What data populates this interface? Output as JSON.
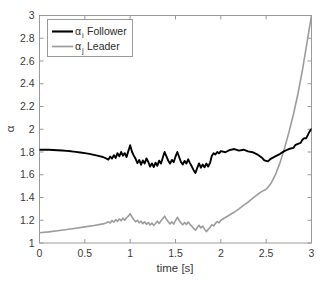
{
  "chart_data": {
    "type": "line",
    "title": "",
    "xlabel": "time [s]",
    "ylabel": "α",
    "xlim": [
      0,
      3
    ],
    "ylim": [
      1,
      3
    ],
    "grid": false,
    "legend_position": "top-left",
    "xticks": [
      "0",
      "0.5",
      "1",
      "1.5",
      "2",
      "2.5",
      "3"
    ],
    "xtick_values": [
      0,
      0.5,
      1,
      1.5,
      2,
      2.5,
      3
    ],
    "yticks": [
      "1",
      "1.2",
      "1.4",
      "1.6",
      "1.8",
      "2",
      "2.2",
      "2.4",
      "2.6",
      "2.8",
      "3"
    ],
    "ytick_values": [
      1,
      1.2,
      1.4,
      1.6,
      1.8,
      2,
      2.2,
      2.4,
      2.6,
      2.8,
      3
    ],
    "series": [
      {
        "name": "αi Follower",
        "label_base": "α",
        "label_sub": "i",
        "label_rest": "Follower",
        "color": "#000000",
        "width": 1.9,
        "points": [
          [
            0.0,
            1.82
          ],
          [
            0.05,
            1.821
          ],
          [
            0.1,
            1.82
          ],
          [
            0.15,
            1.818
          ],
          [
            0.2,
            1.816
          ],
          [
            0.25,
            1.813
          ],
          [
            0.3,
            1.81
          ],
          [
            0.35,
            1.806
          ],
          [
            0.4,
            1.801
          ],
          [
            0.45,
            1.796
          ],
          [
            0.5,
            1.79
          ],
          [
            0.55,
            1.783
          ],
          [
            0.6,
            1.775
          ],
          [
            0.65,
            1.766
          ],
          [
            0.7,
            1.756
          ],
          [
            0.74,
            1.742
          ],
          [
            0.76,
            1.733
          ],
          [
            0.78,
            1.76
          ],
          [
            0.8,
            1.742
          ],
          [
            0.82,
            1.772
          ],
          [
            0.84,
            1.748
          ],
          [
            0.86,
            1.79
          ],
          [
            0.88,
            1.762
          ],
          [
            0.9,
            1.8
          ],
          [
            0.92,
            1.768
          ],
          [
            0.94,
            1.79
          ],
          [
            0.96,
            1.756
          ],
          [
            0.98,
            1.808
          ],
          [
            1.0,
            1.86
          ],
          [
            1.02,
            1.802
          ],
          [
            1.04,
            1.768
          ],
          [
            1.06,
            1.74
          ],
          [
            1.08,
            1.702
          ],
          [
            1.1,
            1.73
          ],
          [
            1.12,
            1.688
          ],
          [
            1.14,
            1.726
          ],
          [
            1.16,
            1.7
          ],
          [
            1.18,
            1.744
          ],
          [
            1.2,
            1.712
          ],
          [
            1.22,
            1.672
          ],
          [
            1.24,
            1.7
          ],
          [
            1.26,
            1.668
          ],
          [
            1.28,
            1.706
          ],
          [
            1.3,
            1.68
          ],
          [
            1.32,
            1.724
          ],
          [
            1.34,
            1.698
          ],
          [
            1.36,
            1.752
          ],
          [
            1.38,
            1.8
          ],
          [
            1.4,
            1.762
          ],
          [
            1.42,
            1.724
          ],
          [
            1.44,
            1.698
          ],
          [
            1.46,
            1.73
          ],
          [
            1.48,
            1.71
          ],
          [
            1.5,
            1.76
          ],
          [
            1.52,
            1.8
          ],
          [
            1.54,
            1.756
          ],
          [
            1.56,
            1.712
          ],
          [
            1.58,
            1.69
          ],
          [
            1.6,
            1.722
          ],
          [
            1.62,
            1.698
          ],
          [
            1.64,
            1.736
          ],
          [
            1.66,
            1.702
          ],
          [
            1.68,
            1.672
          ],
          [
            1.7,
            1.64
          ],
          [
            1.72,
            1.616
          ],
          [
            1.74,
            1.66
          ],
          [
            1.76,
            1.7
          ],
          [
            1.78,
            1.662
          ],
          [
            1.8,
            1.69
          ],
          [
            1.82,
            1.666
          ],
          [
            1.84,
            1.698
          ],
          [
            1.86,
            1.672
          ],
          [
            1.88,
            1.702
          ],
          [
            1.9,
            1.764
          ],
          [
            1.92,
            1.79
          ],
          [
            1.94,
            1.778
          ],
          [
            1.96,
            1.8
          ],
          [
            1.98,
            1.788
          ],
          [
            2.0,
            1.808
          ],
          [
            2.05,
            1.798
          ],
          [
            2.1,
            1.818
          ],
          [
            2.15,
            1.826
          ],
          [
            2.2,
            1.812
          ],
          [
            2.25,
            1.82
          ],
          [
            2.3,
            1.806
          ],
          [
            2.35,
            1.798
          ],
          [
            2.4,
            1.78
          ],
          [
            2.45,
            1.752
          ],
          [
            2.48,
            1.726
          ],
          [
            2.52,
            1.718
          ],
          [
            2.55,
            1.74
          ],
          [
            2.6,
            1.762
          ],
          [
            2.65,
            1.782
          ],
          [
            2.7,
            1.808
          ],
          [
            2.75,
            1.826
          ],
          [
            2.8,
            1.836
          ],
          [
            2.82,
            1.86
          ],
          [
            2.85,
            1.872
          ],
          [
            2.88,
            1.88
          ],
          [
            2.9,
            1.908
          ],
          [
            2.92,
            1.922
          ],
          [
            2.94,
            1.92
          ],
          [
            2.96,
            1.95
          ],
          [
            2.98,
            1.982
          ],
          [
            3.0,
            2.002
          ]
        ]
      },
      {
        "name": "αj Leader",
        "label_base": "α",
        "label_sub": "j",
        "label_rest": "Leader",
        "color": "#9c9c9c",
        "width": 1.6,
        "points": [
          [
            0.0,
            1.09
          ],
          [
            0.1,
            1.098
          ],
          [
            0.2,
            1.108
          ],
          [
            0.3,
            1.118
          ],
          [
            0.4,
            1.13
          ],
          [
            0.5,
            1.142
          ],
          [
            0.6,
            1.154
          ],
          [
            0.7,
            1.168
          ],
          [
            0.74,
            1.178
          ],
          [
            0.76,
            1.186
          ],
          [
            0.78,
            1.176
          ],
          [
            0.8,
            1.198
          ],
          [
            0.82,
            1.182
          ],
          [
            0.84,
            1.206
          ],
          [
            0.86,
            1.19
          ],
          [
            0.88,
            1.212
          ],
          [
            0.9,
            1.196
          ],
          [
            0.92,
            1.218
          ],
          [
            0.94,
            1.2
          ],
          [
            0.96,
            1.222
          ],
          [
            0.98,
            1.236
          ],
          [
            1.0,
            1.258
          ],
          [
            1.02,
            1.228
          ],
          [
            1.04,
            1.206
          ],
          [
            1.06,
            1.186
          ],
          [
            1.08,
            1.2
          ],
          [
            1.1,
            1.178
          ],
          [
            1.12,
            1.192
          ],
          [
            1.14,
            1.17
          ],
          [
            1.16,
            1.186
          ],
          [
            1.18,
            1.164
          ],
          [
            1.2,
            1.18
          ],
          [
            1.22,
            1.158
          ],
          [
            1.24,
            1.176
          ],
          [
            1.26,
            1.154
          ],
          [
            1.28,
            1.172
          ],
          [
            1.3,
            1.192
          ],
          [
            1.32,
            1.172
          ],
          [
            1.34,
            1.196
          ],
          [
            1.36,
            1.216
          ],
          [
            1.38,
            1.236
          ],
          [
            1.4,
            1.208
          ],
          [
            1.42,
            1.186
          ],
          [
            1.44,
            1.168
          ],
          [
            1.46,
            1.186
          ],
          [
            1.48,
            1.166
          ],
          [
            1.5,
            1.196
          ],
          [
            1.52,
            1.226
          ],
          [
            1.54,
            1.2
          ],
          [
            1.56,
            1.176
          ],
          [
            1.58,
            1.16
          ],
          [
            1.6,
            1.18
          ],
          [
            1.62,
            1.162
          ],
          [
            1.64,
            1.184
          ],
          [
            1.66,
            1.164
          ],
          [
            1.68,
            1.148
          ],
          [
            1.7,
            1.128
          ],
          [
            1.72,
            1.112
          ],
          [
            1.74,
            1.136
          ],
          [
            1.76,
            1.156
          ],
          [
            1.78,
            1.132
          ],
          [
            1.8,
            1.148
          ],
          [
            1.82,
            1.122
          ],
          [
            1.84,
            1.1
          ],
          [
            1.86,
            1.118
          ],
          [
            1.88,
            1.136
          ],
          [
            1.9,
            1.16
          ],
          [
            1.92,
            1.15
          ],
          [
            1.94,
            1.172
          ],
          [
            1.96,
            1.188
          ],
          [
            1.98,
            1.178
          ],
          [
            2.0,
            1.2
          ],
          [
            2.05,
            1.224
          ],
          [
            2.1,
            1.248
          ],
          [
            2.15,
            1.272
          ],
          [
            2.2,
            1.3
          ],
          [
            2.25,
            1.33
          ],
          [
            2.3,
            1.36
          ],
          [
            2.35,
            1.392
          ],
          [
            2.4,
            1.424
          ],
          [
            2.45,
            1.452
          ],
          [
            2.5,
            1.472
          ],
          [
            2.55,
            1.52
          ],
          [
            2.6,
            1.596
          ],
          [
            2.65,
            1.7
          ],
          [
            2.7,
            1.826
          ],
          [
            2.75,
            1.97
          ],
          [
            2.8,
            2.13
          ],
          [
            2.85,
            2.31
          ],
          [
            2.9,
            2.52
          ],
          [
            2.95,
            2.76
          ],
          [
            3.0,
            3.0
          ]
        ]
      }
    ]
  },
  "axes": {
    "frame_color": "#9a9a9a",
    "tick_color": "#9a9a9a",
    "label_color": "#3a3a3a"
  }
}
